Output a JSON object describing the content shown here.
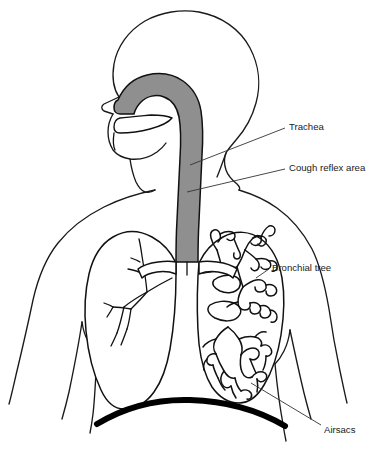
{
  "diagram": {
    "title": "Respiratory system — head, trachea and lungs",
    "view": "anterior torso with left-facing head profile",
    "colors": {
      "background": "#ffffff",
      "outline": "#1a1a1a",
      "airway_shading": "#8f8f8f",
      "diaphragm": "#000000",
      "leader_line": "#333333",
      "label_text": "#1a1a1a"
    },
    "labels": [
      {
        "id": "trachea",
        "text": "Trachea",
        "text_x": 289,
        "text_y": 127,
        "leader_from_x": 285,
        "leader_from_y": 128,
        "leader_to_x": 190,
        "leader_to_y": 165
      },
      {
        "id": "cough-reflex-area",
        "text": "Cough reflex area",
        "text_x": 289,
        "text_y": 168,
        "leader_from_x": 285,
        "leader_from_y": 169,
        "leader_to_x": 187,
        "leader_to_y": 192
      },
      {
        "id": "bronchial-tree",
        "text": "Bronchial tree",
        "text_x": 272,
        "text_y": 268,
        "leader_from_x": 269,
        "leader_from_y": 269,
        "leader_to_x": 256,
        "leader_to_y": 278
      },
      {
        "id": "airsacs",
        "text": "Airsacs",
        "text_x": 324,
        "text_y": 430,
        "leader_from_x": 321,
        "leader_from_y": 425,
        "leader_to_x": 251,
        "leader_to_y": 383
      }
    ],
    "structures": [
      {
        "id": "head-profile",
        "name": "head and face outline"
      },
      {
        "id": "nasal-cavity",
        "name": "nasal cavity"
      },
      {
        "id": "tongue",
        "name": "tongue"
      },
      {
        "id": "pharynx",
        "name": "pharynx"
      },
      {
        "id": "trachea-shaft",
        "name": "trachea"
      },
      {
        "id": "left-lung",
        "name": "left lung with bronchial branches"
      },
      {
        "id": "right-lung",
        "name": "right lung with bronchial tree and airsacs"
      },
      {
        "id": "diaphragm",
        "name": "diaphragm"
      },
      {
        "id": "torso",
        "name": "torso, shoulders and arms"
      }
    ]
  }
}
